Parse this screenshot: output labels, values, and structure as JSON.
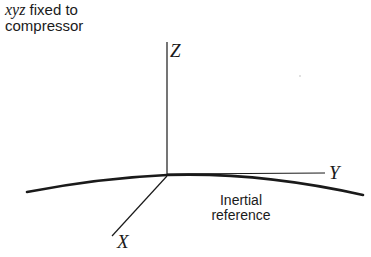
{
  "caption": {
    "variables": "xyz",
    "line1_rest": " fixed to",
    "line2": "compressor"
  },
  "axes": {
    "z_label": "Z",
    "y_label": "Y",
    "x_label": "X"
  },
  "reference": {
    "line1": "Inertial",
    "line2": "reference"
  },
  "colors": {
    "ink": "#1a1a1a",
    "background": "#ffffff"
  }
}
